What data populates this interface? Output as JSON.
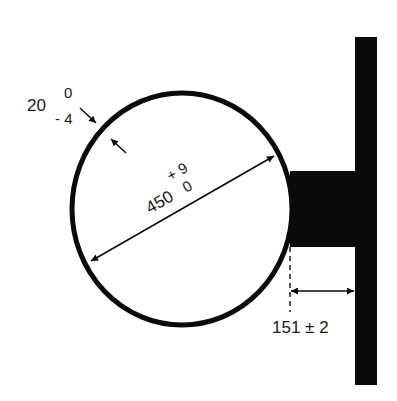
{
  "drawing": {
    "type": "engineering-dimension-drawing",
    "colors": {
      "ink": "#0a0a0a",
      "background": "#ffffff"
    },
    "pipe": {
      "diameter_nominal": "450",
      "diameter_upper_tol": "+ 9",
      "diameter_lower_tol": "0",
      "wall_nominal": "20",
      "wall_upper_tol": "0",
      "wall_lower_tol": "- 4"
    },
    "offset": {
      "label": "151 ± 2"
    }
  }
}
